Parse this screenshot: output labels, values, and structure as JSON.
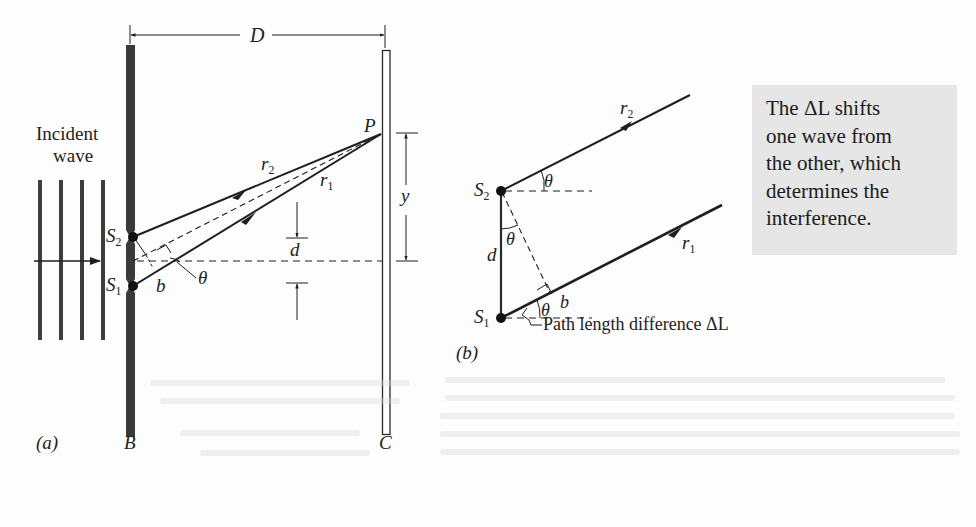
{
  "figure": {
    "panel_a": {
      "panel_label": "(a)",
      "incident_wave_label_line1": "Incident",
      "incident_wave_label_line2": "wave",
      "barrier_label": "B",
      "screen_label": "C",
      "distance_label": "D",
      "point_label": "P",
      "height_label": "y",
      "separation_label": "d",
      "slit_upper": {
        "letter": "S",
        "sub": "2"
      },
      "slit_lower": {
        "letter": "S",
        "sub": "1"
      },
      "ray_upper": {
        "letter": "r",
        "sub": "2"
      },
      "ray_lower": {
        "letter": "r",
        "sub": "1"
      },
      "angle_label": "θ",
      "path_diff_label": "b"
    },
    "panel_b": {
      "panel_label": "(b)",
      "slit_upper": {
        "letter": "S",
        "sub": "2"
      },
      "slit_lower": {
        "letter": "S",
        "sub": "1"
      },
      "ray_upper": {
        "letter": "r",
        "sub": "2"
      },
      "ray_lower": {
        "letter": "r",
        "sub": "1"
      },
      "separation_label": "d",
      "angle_label": "θ",
      "path_diff_label": "b",
      "path_diff_caption": "Path length difference ΔL"
    },
    "callout": {
      "lines": [
        "The ΔL shifts",
        "one wave from",
        "the other, which",
        "determines the",
        "interference."
      ],
      "background": "#e6e6e6"
    },
    "colors": {
      "ink": "#1e1e1e",
      "barrier_fill": "#3a3a3a",
      "wavefront": "#3d3d3d",
      "background": "#fdfdfd"
    }
  }
}
